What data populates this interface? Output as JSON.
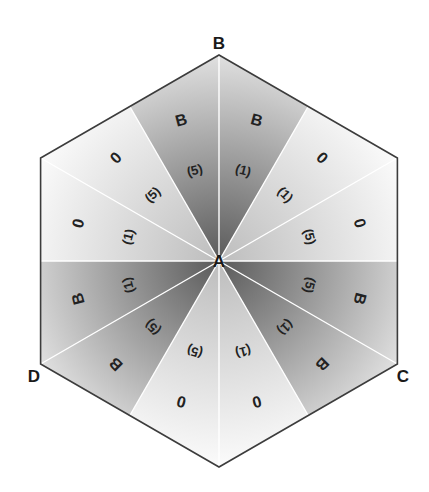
{
  "diagram": {
    "center_label": "A",
    "vertex_labels": {
      "top": "B",
      "bottom_right": "C",
      "bottom_left": "D"
    },
    "colors": {
      "dark": "#6e6e6e",
      "light": "#f4f4f4",
      "edge": "#3c3c3c",
      "divider": "#ffffff"
    },
    "sectors": [
      {
        "shade": "dark",
        "outer": "B",
        "inner": "(1)"
      },
      {
        "shade": "light",
        "outer": "0",
        "inner": "(1)"
      },
      {
        "shade": "light",
        "outer": "0",
        "inner": "(5)"
      },
      {
        "shade": "dark",
        "outer": "B",
        "inner": "(5)"
      },
      {
        "shade": "dark",
        "outer": "B",
        "inner": "(1)"
      },
      {
        "shade": "light",
        "outer": "0",
        "inner": "(1)"
      },
      {
        "shade": "light",
        "outer": "0",
        "inner": "(5)"
      },
      {
        "shade": "dark",
        "outer": "B",
        "inner": "(5)"
      },
      {
        "shade": "dark",
        "outer": "B",
        "inner": "(1)"
      },
      {
        "shade": "light",
        "outer": "0",
        "inner": "(1)"
      },
      {
        "shade": "light",
        "outer": "0",
        "inner": "(5)"
      },
      {
        "shade": "dark",
        "outer": "B",
        "inner": "(5)"
      }
    ]
  }
}
